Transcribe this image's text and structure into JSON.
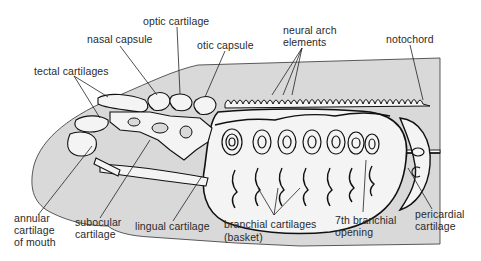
{
  "diagram": {
    "colors": {
      "background": "#ffffff",
      "body_fill": "#d9d9d9",
      "cartilage_fill": "#f4f4f4",
      "outline": "#1a1a1a",
      "label_text": "#2a2a2a"
    },
    "labels": {
      "optic_cartilage": "optic cartilage",
      "nasal_capsule": "nasal capsule",
      "otic_capsule": "otic capsule",
      "neural_arch_line1": "neural arch",
      "neural_arch_line2": "elements",
      "notochord": "notochord",
      "tectal_cartilages": "tectal cartilages",
      "annular_line1": "annular",
      "annular_line2": "cartilage",
      "annular_line3": "of mouth",
      "subocular_line1": "subocular",
      "subocular_line2": "cartilage",
      "lingual_cartilage": "lingual cartilage",
      "branchial_line1": "branchial cartilages",
      "branchial_line2": "(basket)",
      "seventh_line1": "7th branchial",
      "seventh_line2": "opening",
      "pericardial_line1": "pericardial",
      "pericardial_line2": "cartilage"
    },
    "branchial_openings_count": 7
  }
}
